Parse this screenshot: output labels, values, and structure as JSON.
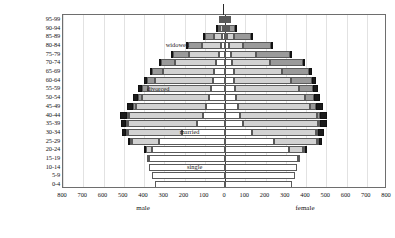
{
  "chart_data": {
    "type": "bar",
    "subtype": "population-pyramid-stacked",
    "title": "",
    "xlabel": "",
    "ylabel": "age group",
    "xlim": [
      -800,
      800
    ],
    "ylim_categories": 20,
    "grid": true,
    "legend_position": "inline-annotations",
    "xticks": [
      800,
      700,
      600,
      500,
      400,
      300,
      200,
      100,
      0,
      100,
      200,
      300,
      400,
      500,
      600,
      700,
      800
    ],
    "side_labels": {
      "left": "male",
      "right": "female"
    },
    "categories": [
      "0-4",
      "5-9",
      "10-14",
      "15-19",
      "20-24",
      "25-29",
      "30-34",
      "35-39",
      "40-44",
      "45-49",
      "50-54",
      "55-59",
      "60-64",
      "65-69",
      "70-74",
      "75-79",
      "80-84",
      "85-89",
      "90-94",
      "95-99"
    ],
    "status_order": [
      "single",
      "married",
      "widowed",
      "divorced"
    ],
    "status_colors": {
      "single": "#ffffff",
      "married": "#d2d2d2",
      "widowed": "#9a9a9a",
      "divorced": "#1b1b1b"
    },
    "annotations": [
      {
        "text": "single",
        "x": -150,
        "category": "10-14"
      },
      {
        "text": "married",
        "x": -175,
        "category": "30-34"
      },
      {
        "text": "divorced",
        "x": -330,
        "category": "55-59"
      },
      {
        "text": "widowed",
        "x": -235,
        "category": "80-84"
      }
    ],
    "series": [
      {
        "name": "male single",
        "values": [
          345,
          360,
          375,
          385,
          370,
          330,
          215,
          140,
          110,
          95,
          80,
          70,
          60,
          52,
          42,
          32,
          22,
          13,
          7,
          3
        ]
      },
      {
        "name": "male married",
        "values": [
          0,
          0,
          0,
          2,
          28,
          135,
          270,
          340,
          365,
          345,
          330,
          310,
          285,
          255,
          205,
          150,
          95,
          48,
          18,
          5
        ]
      },
      {
        "name": "male widowed",
        "values": [
          0,
          0,
          0,
          0,
          0,
          2,
          4,
          7,
          10,
          14,
          20,
          28,
          38,
          52,
          70,
          80,
          72,
          45,
          20,
          6
        ]
      },
      {
        "name": "male divorced",
        "values": [
          0,
          0,
          0,
          0,
          2,
          14,
          22,
          28,
          32,
          30,
          26,
          22,
          18,
          14,
          10,
          6,
          4,
          2,
          1,
          0
        ]
      },
      {
        "name": "female single",
        "values": [
          330,
          345,
          355,
          365,
          330,
          245,
          135,
          90,
          72,
          62,
          55,
          50,
          46,
          42,
          36,
          28,
          20,
          12,
          6,
          3
        ]
      },
      {
        "name": "female married",
        "values": [
          0,
          0,
          0,
          5,
          72,
          215,
          320,
          370,
          380,
          360,
          340,
          315,
          282,
          240,
          185,
          125,
          72,
          34,
          12,
          3
        ]
      },
      {
        "name": "female widowed",
        "values": [
          0,
          0,
          0,
          0,
          1,
          3,
          6,
          11,
          18,
          28,
          45,
          70,
          100,
          135,
          165,
          170,
          140,
          88,
          38,
          11
        ]
      },
      {
        "name": "female divorced",
        "values": [
          0,
          0,
          0,
          0,
          3,
          16,
          26,
          33,
          36,
          34,
          30,
          25,
          20,
          15,
          10,
          6,
          3,
          2,
          1,
          0
        ]
      }
    ]
  }
}
